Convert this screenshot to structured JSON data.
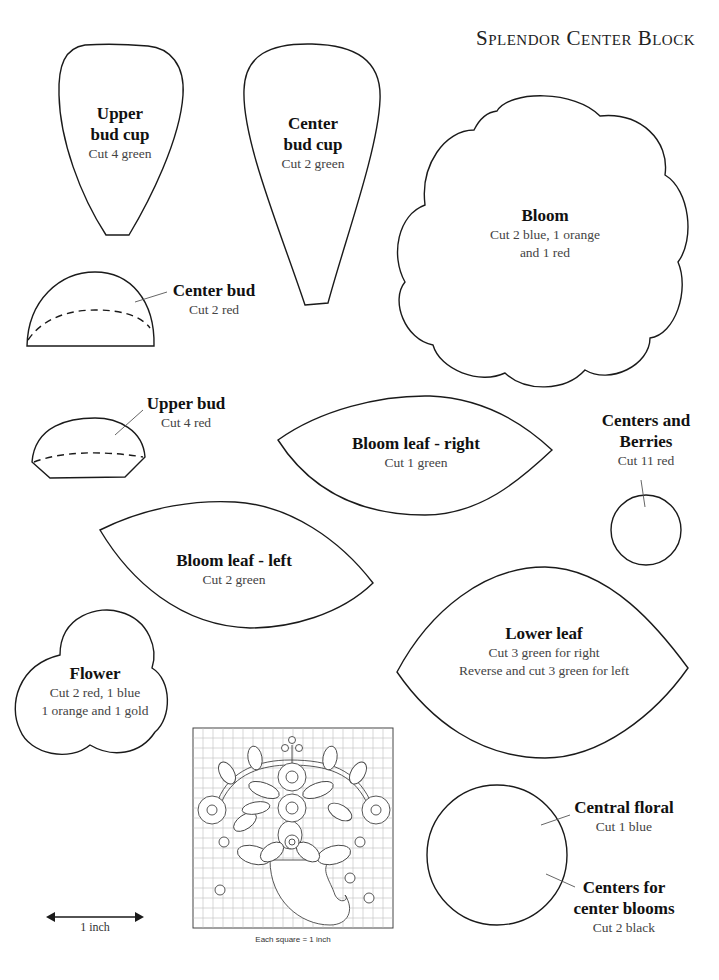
{
  "page": {
    "title": "Splendor Center Block"
  },
  "pieces": {
    "upper_bud_cup": {
      "name_line1": "Upper",
      "name_line2": "bud cup",
      "cut": "Cut 4 green"
    },
    "center_bud_cup": {
      "name_line1": "Center",
      "name_line2": "bud cup",
      "cut": "Cut 2 green"
    },
    "bloom": {
      "name": "Bloom",
      "cut_line1": "Cut 2 blue, 1 orange",
      "cut_line2": "and 1 red"
    },
    "center_bud": {
      "name": "Center bud",
      "cut": "Cut 2 red"
    },
    "upper_bud": {
      "name": "Upper bud",
      "cut": "Cut 4 red"
    },
    "bloom_leaf_right": {
      "name": "Bloom leaf - right",
      "cut": "Cut 1 green"
    },
    "centers_and_berries": {
      "name_line1": "Centers and",
      "name_line2": "Berries",
      "cut": "Cut 11 red"
    },
    "bloom_leaf_left": {
      "name": "Bloom leaf - left",
      "cut": "Cut 2 green"
    },
    "lower_leaf": {
      "name": "Lower leaf",
      "cut_line1": "Cut 3 green for right",
      "cut_line2": "Reverse and cut 3 green for left"
    },
    "flower": {
      "name": "Flower",
      "cut_line1": "Cut 2 red, 1 blue",
      "cut_line2": "1 orange and 1 gold"
    },
    "central_floral": {
      "name": "Central floral",
      "cut": "Cut 1 blue"
    },
    "centers_for_center_blooms": {
      "name_line1": "Centers for",
      "name_line2": "center blooms",
      "cut": "Cut 2 black"
    }
  },
  "layout_diagram": {
    "caption": "Each square = 1 inch",
    "grid_columns": 20,
    "grid_rows": 20
  },
  "scale_bar": {
    "label": "1 inch"
  },
  "colors": {
    "outline": "#1a1a1a",
    "leader": "#555555",
    "grid": "#b8b8b8",
    "background": "#ffffff"
  }
}
